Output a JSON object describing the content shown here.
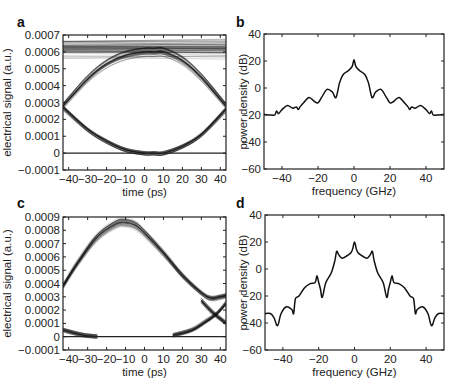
{
  "figure": {
    "panels": [
      {
        "letter": "a"
      },
      {
        "letter": "b"
      },
      {
        "letter": "c"
      },
      {
        "letter": "d"
      }
    ]
  },
  "chart_data": [
    {
      "panel": "a",
      "type": "line",
      "title": "",
      "description": "Eye diagram: overlaid traces of electrical signal vs time",
      "xlabel": "time (ps)",
      "ylabel": "electrical signal (a.u.)",
      "xlim": [
        -43,
        43
      ],
      "ylim": [
        -0.0001,
        0.0007
      ],
      "xticks": [
        -40,
        -30,
        -20,
        -10,
        0,
        10,
        20,
        30,
        40
      ],
      "xtick_labels": [
        "−40",
        "−30",
        "−20",
        "−10",
        "0",
        "10",
        "20",
        "30",
        "40"
      ],
      "yticks": [
        -0.0001,
        0,
        0.0001,
        0.0002,
        0.0003,
        0.0004,
        0.0005,
        0.0006,
        0.0007
      ],
      "ytick_labels": [
        "−0.0001",
        "0",
        "0.0001",
        "0.0002",
        "0.0003",
        "0.0004",
        "0.0005",
        "0.0006",
        "0.0007"
      ],
      "grid": false,
      "series": [
        {
          "name": "high level (flat '1' traces)",
          "x": [
            -43,
            0,
            43
          ],
          "y": [
            0.00062,
            0.00062,
            0.00062
          ],
          "spread": [
            0.00056,
            0.00067
          ]
        },
        {
          "name": "rising/falling upper arc",
          "x": [
            -43,
            -30,
            -20,
            -10,
            0,
            5,
            10,
            20,
            30,
            43
          ],
          "y": [
            0.00028,
            0.00044,
            0.00053,
            0.00058,
            0.0006,
            0.0006,
            0.0006,
            0.00055,
            0.00045,
            0.00028
          ]
        },
        {
          "name": "lower arc (falling to zero)",
          "x": [
            -43,
            -30,
            -20,
            -10,
            0,
            5,
            10,
            20,
            30,
            43
          ],
          "y": [
            0.00027,
            0.00014,
            7e-05,
            2e-05,
            0.0,
            0.0,
            0.0,
            4e-05,
            0.00011,
            0.00026
          ]
        },
        {
          "name": "zero level",
          "x": [
            -43,
            43
          ],
          "y": [
            0.0,
            0.0
          ]
        }
      ]
    },
    {
      "panel": "b",
      "type": "line",
      "title": "",
      "xlabel": "frequency (GHz)",
      "ylabel": "power density (dB)",
      "xlim": [
        -50,
        50
      ],
      "ylim": [
        -60,
        40
      ],
      "xticks": [
        -40,
        -20,
        0,
        20,
        40
      ],
      "xtick_labels": [
        "−40",
        "−20",
        "0",
        "20",
        "40"
      ],
      "yticks": [
        -60,
        -40,
        -20,
        0,
        20,
        40
      ],
      "ytick_labels": [
        "−60",
        "−40",
        "−20",
        "0",
        "20",
        "40"
      ],
      "grid": false,
      "x": [
        -50,
        -46,
        -44,
        -43,
        -42,
        -40,
        -37,
        -34,
        -32,
        -31,
        -30,
        -28,
        -25,
        -22,
        -20,
        -18,
        -15,
        -12,
        -10,
        -8,
        -6,
        -3,
        -1,
        0,
        1,
        3,
        6,
        8,
        10,
        12,
        15,
        18,
        20,
        22,
        25,
        28,
        30,
        31,
        32,
        34,
        37,
        40,
        42,
        43,
        44,
        46,
        50
      ],
      "y": [
        -19.5,
        -20,
        -20,
        -17,
        -19,
        -16,
        -13,
        -15,
        -14,
        -16,
        -14,
        -11,
        -7,
        -10,
        -11,
        -7,
        -1,
        -3,
        -7,
        4,
        10,
        13,
        16,
        21,
        16,
        13,
        10,
        4,
        -7,
        -3,
        -1,
        -7,
        -11,
        -10,
        -7,
        -11,
        -14,
        -16,
        -14,
        -15,
        -13,
        -16,
        -19,
        -17,
        -20,
        -20,
        -19.5
      ]
    },
    {
      "panel": "c",
      "type": "line",
      "title": "",
      "description": "Eye diagram with distorted traces of electrical signal vs time",
      "xlabel": "time (ps)",
      "ylabel": "electrical signal (a.u.)",
      "xlim": [
        -43,
        43
      ],
      "ylim": [
        -0.0001,
        0.0009
      ],
      "xticks": [
        -40,
        -30,
        -20,
        -10,
        0,
        10,
        20,
        30,
        40
      ],
      "xtick_labels": [
        "−40",
        "−30",
        "−20",
        "−10",
        "0",
        "10",
        "20",
        "30",
        "40"
      ],
      "yticks": [
        -0.0001,
        0,
        0.0001,
        0.0002,
        0.0003,
        0.0004,
        0.0005,
        0.0006,
        0.0007,
        0.0008,
        0.0009
      ],
      "ytick_labels": [
        "−0.0001",
        "0",
        "0.0001",
        "0.0002",
        "0.0003",
        "0.0004",
        "0.0005",
        "0.0006",
        "0.0007",
        "0.0008",
        "0.0009"
      ],
      "grid": false,
      "series": [
        {
          "name": "main pulse",
          "x": [
            -43,
            -35,
            -25,
            -15,
            -10,
            -5,
            0,
            10,
            20,
            30,
            35,
            40,
            43
          ],
          "y": [
            0.00038,
            0.00056,
            0.00075,
            0.00085,
            0.00086,
            0.00084,
            0.00078,
            0.00063,
            0.00046,
            0.00033,
            0.00029,
            0.0003,
            0.00031
          ]
        },
        {
          "name": "falling tail",
          "x": [
            30,
            36,
            43
          ],
          "y": [
            0.00027,
            0.00018,
            0.0001
          ]
        },
        {
          "name": "rising next pulse",
          "x": [
            15,
            25,
            32,
            38,
            43
          ],
          "y": [
            1e-05,
            5e-05,
            0.00011,
            0.00017,
            0.00025
          ]
        },
        {
          "name": "decaying previous pulse",
          "x": [
            -43,
            -38,
            -32,
            -25
          ],
          "y": [
            5e-05,
            3e-05,
            1e-05,
            0.0
          ]
        },
        {
          "name": "zero level",
          "x": [
            -43,
            43
          ],
          "y": [
            0.0,
            0.0
          ]
        }
      ]
    },
    {
      "panel": "d",
      "type": "line",
      "title": "",
      "xlabel": "frequency (GHz)",
      "ylabel": "power density (dB)",
      "xlim": [
        -50,
        50
      ],
      "ylim": [
        -60,
        40
      ],
      "xticks": [
        -40,
        -20,
        0,
        20,
        40
      ],
      "xtick_labels": [
        "−40",
        "−20",
        "0",
        "20",
        "40"
      ],
      "yticks": [
        -60,
        -40,
        -20,
        0,
        20,
        40
      ],
      "ytick_labels": [
        "−60",
        "−40",
        "−20",
        "0",
        "20",
        "40"
      ],
      "grid": false,
      "x": [
        -50,
        -47,
        -45,
        -43,
        -41,
        -38,
        -35,
        -34,
        -33,
        -31,
        -28,
        -25,
        -22,
        -21,
        -20,
        -19,
        -18,
        -16,
        -13,
        -11,
        -10,
        -9,
        -7,
        -4,
        -2,
        -1,
        0,
        1,
        2,
        4,
        7,
        9,
        10,
        11,
        13,
        16,
        18,
        19,
        20,
        21,
        22,
        25,
        28,
        31,
        33,
        34,
        35,
        38,
        41,
        43,
        45,
        47,
        50
      ],
      "y": [
        -33,
        -33,
        -36,
        -42,
        -33,
        -28,
        -30,
        -33,
        -22,
        -20,
        -14,
        -11,
        -10,
        -5,
        -10,
        -15,
        -21,
        -10,
        -3,
        6,
        13,
        11,
        8,
        10,
        12,
        15,
        20,
        15,
        12,
        10,
        8,
        11,
        13,
        6,
        -3,
        -10,
        -21,
        -15,
        -10,
        -5,
        -10,
        -11,
        -14,
        -20,
        -22,
        -33,
        -30,
        -28,
        -33,
        -42,
        -36,
        -33,
        -33
      ]
    }
  ]
}
